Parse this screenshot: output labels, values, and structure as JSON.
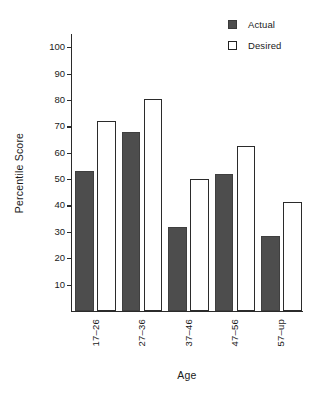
{
  "chart_data": {
    "type": "bar",
    "title": "",
    "subtitle": "",
    "xlabel": "Age",
    "ylabel": "Percentile Score",
    "categories": [
      "17–26",
      "27–36",
      "37–46",
      "47–56",
      "57–up"
    ],
    "series": [
      {
        "name": "Actual",
        "color": "#4d4d4d",
        "style": "filled",
        "values": [
          53,
          68,
          32,
          52,
          28.5
        ]
      },
      {
        "name": "Desired",
        "color": "#ffffff",
        "style": "outline",
        "values": [
          72,
          80.5,
          50,
          62.5,
          41.5
        ]
      }
    ],
    "ylim": [
      0,
      105
    ],
    "yticks": [
      10,
      20,
      30,
      40,
      50,
      60,
      70,
      80,
      90,
      100
    ],
    "ytick_labels": [
      "10",
      "20",
      "30",
      "40",
      "50",
      "60",
      "70",
      "80",
      "90",
      "100"
    ],
    "grid": false,
    "legend": {
      "position": "top-right",
      "entries": [
        {
          "label": "Actual",
          "swatch": "filled-square-icon"
        },
        {
          "label": "Desired",
          "swatch": "open-square-icon"
        }
      ]
    },
    "axis_line_color": "#2b2b2b",
    "background": "#ffffff"
  }
}
